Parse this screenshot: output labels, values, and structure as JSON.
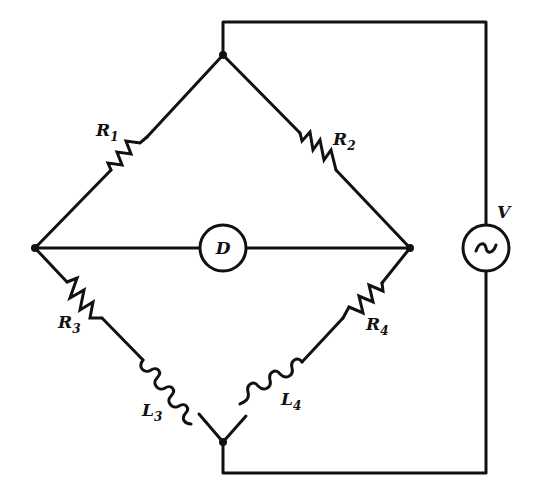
{
  "diagram": {
    "components": {
      "R1": {
        "symbol": "R",
        "subscript": "1",
        "type": "resistor"
      },
      "R2": {
        "symbol": "R",
        "subscript": "2",
        "type": "resistor"
      },
      "R3": {
        "symbol": "R",
        "subscript": "3",
        "type": "resistor"
      },
      "R4": {
        "symbol": "R",
        "subscript": "4",
        "type": "resistor"
      },
      "L3": {
        "symbol": "L",
        "subscript": "3",
        "type": "inductor"
      },
      "L4": {
        "symbol": "L",
        "subscript": "4",
        "type": "inductor"
      },
      "D": {
        "symbol": "D",
        "type": "detector"
      },
      "V": {
        "symbol": "V",
        "type": "ac-source",
        "glyph": "~"
      }
    },
    "colors": {
      "line": "#111111",
      "background": "#ffffff"
    }
  }
}
